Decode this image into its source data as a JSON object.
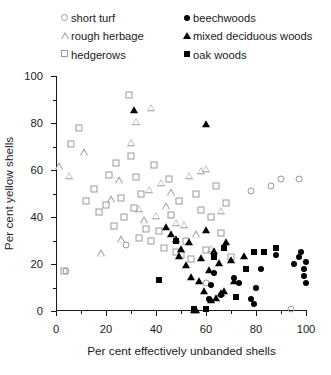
{
  "chart_data": {
    "type": "scatter",
    "title": "",
    "xlabel": "Per cent effectively unbanded shells",
    "ylabel": "Per cent yellow shells",
    "xlim": [
      0,
      100
    ],
    "ylim": [
      0,
      100
    ],
    "xticks": [
      0,
      20,
      40,
      60,
      80,
      100
    ],
    "yticks": [
      0,
      20,
      40,
      60,
      80,
      100
    ],
    "xminorticks": [
      10,
      30,
      50,
      70,
      90
    ],
    "yminorticks": [
      10,
      30,
      50,
      70,
      90
    ],
    "grid": false,
    "legend_position": "top",
    "series": [
      {
        "name": "short turf",
        "marker": "circle-open",
        "points": [
          [
            4,
            17
          ],
          [
            28,
            28
          ],
          [
            60,
            12
          ],
          [
            78,
            51
          ],
          [
            86,
            53
          ],
          [
            90,
            56
          ],
          [
            94,
            1
          ],
          [
            97,
            56
          ]
        ]
      },
      {
        "name": "rough herbage",
        "marker": "triangle-open",
        "points": [
          [
            1,
            62
          ],
          [
            5,
            58
          ],
          [
            11,
            68
          ],
          [
            18,
            25
          ],
          [
            22,
            48
          ],
          [
            25,
            56
          ],
          [
            26,
            31
          ],
          [
            30,
            72
          ],
          [
            32,
            81
          ],
          [
            33,
            44
          ],
          [
            35,
            39
          ],
          [
            37,
            52
          ],
          [
            38,
            87
          ],
          [
            40,
            41
          ],
          [
            42,
            55
          ],
          [
            44,
            45
          ],
          [
            46,
            51
          ],
          [
            48,
            38
          ],
          [
            51,
            37
          ],
          [
            53,
            58
          ],
          [
            56,
            33
          ],
          [
            58,
            60
          ],
          [
            60,
            61
          ],
          [
            62,
            27
          ],
          [
            66,
            43
          ]
        ]
      },
      {
        "name": "hedgerows",
        "marker": "square-open",
        "points": [
          [
            3,
            17
          ],
          [
            6,
            71
          ],
          [
            9,
            78
          ],
          [
            12,
            47
          ],
          [
            15,
            52
          ],
          [
            17,
            42
          ],
          [
            20,
            45
          ],
          [
            21,
            58
          ],
          [
            23,
            36
          ],
          [
            24,
            63
          ],
          [
            26,
            48
          ],
          [
            27,
            40
          ],
          [
            29,
            92
          ],
          [
            30,
            66
          ],
          [
            31,
            44
          ],
          [
            32,
            57
          ],
          [
            33,
            31
          ],
          [
            34,
            50
          ],
          [
            36,
            35
          ],
          [
            38,
            30
          ],
          [
            39,
            62
          ],
          [
            41,
            34
          ],
          [
            43,
            27
          ],
          [
            45,
            56
          ],
          [
            46,
            41
          ],
          [
            48,
            25
          ],
          [
            49,
            47
          ],
          [
            50,
            24
          ],
          [
            52,
            30
          ],
          [
            54,
            22
          ],
          [
            56,
            50
          ],
          [
            58,
            43
          ],
          [
            60,
            26
          ],
          [
            62,
            40
          ],
          [
            64,
            53
          ],
          [
            66,
            33
          ],
          [
            68,
            46
          ],
          [
            70,
            23
          ]
        ]
      },
      {
        "name": "beechwoods",
        "marker": "circle-solid",
        "points": [
          [
            61,
            5
          ],
          [
            62,
            11
          ],
          [
            63,
            16
          ],
          [
            66,
            7
          ],
          [
            71,
            14
          ],
          [
            73,
            12
          ],
          [
            78,
            5
          ],
          [
            79,
            3
          ],
          [
            80,
            10
          ],
          [
            82,
            18
          ],
          [
            88,
            24
          ],
          [
            95,
            20
          ],
          [
            97,
            23
          ],
          [
            98,
            25
          ],
          [
            99,
            15
          ],
          [
            99,
            18
          ],
          [
            100,
            12
          ],
          [
            100,
            21
          ]
        ]
      },
      {
        "name": "mixed deciduous woods",
        "marker": "triangle-solid",
        "points": [
          [
            31,
            86
          ],
          [
            60,
            80
          ],
          [
            44,
            36
          ],
          [
            46,
            33
          ],
          [
            48,
            31
          ],
          [
            49,
            24
          ],
          [
            50,
            27
          ],
          [
            52,
            20
          ],
          [
            53,
            30
          ],
          [
            54,
            15
          ],
          [
            55,
            1
          ],
          [
            56,
            1
          ],
          [
            57,
            13
          ],
          [
            58,
            23
          ],
          [
            59,
            9
          ],
          [
            60,
            35
          ],
          [
            61,
            18
          ],
          [
            62,
            5
          ],
          [
            63,
            26
          ],
          [
            64,
            6
          ],
          [
            65,
            21
          ],
          [
            66,
            8
          ],
          [
            67,
            9
          ],
          [
            68,
            30
          ],
          [
            70,
            22
          ],
          [
            71,
            13
          ],
          [
            75,
            24
          ]
        ]
      },
      {
        "name": "oak woods",
        "marker": "square-solid",
        "points": [
          [
            41,
            13
          ],
          [
            48,
            30
          ],
          [
            55,
            1
          ],
          [
            60,
            1
          ],
          [
            63,
            23
          ],
          [
            67,
            27
          ],
          [
            72,
            6
          ],
          [
            76,
            18
          ],
          [
            79,
            25
          ],
          [
            83,
            25
          ],
          [
            88,
            27
          ]
        ]
      }
    ]
  },
  "legend": {
    "columns": [
      {
        "entries": [
          {
            "label": "short turf",
            "marker": "circle-open-icon"
          },
          {
            "label": "rough herbage",
            "marker": "triangle-open-icon"
          },
          {
            "label": "hedgerows",
            "marker": "square-open-icon"
          }
        ]
      },
      {
        "entries": [
          {
            "label": "beechwoods",
            "marker": "circle-solid-icon"
          },
          {
            "label": "mixed deciduous woods",
            "marker": "triangle-solid-icon"
          },
          {
            "label": "oak woods",
            "marker": "square-solid-icon"
          }
        ]
      }
    ]
  },
  "colors": {
    "open_marker": "#9a9a9a",
    "solid_marker": "#000000",
    "axis": "#1a1a1a",
    "background": "#ffffff"
  }
}
